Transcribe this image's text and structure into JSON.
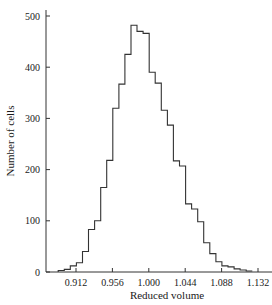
{
  "chart_data": {
    "type": "bar",
    "subtype": "histogram-step",
    "title": "",
    "xlabel": "Reduced volume",
    "ylabel": "Number of cells",
    "x_ticks": [
      0.912,
      0.956,
      1.0,
      1.044,
      1.088,
      1.132
    ],
    "x_tick_labels": [
      "0.912",
      "0.956",
      "1.000",
      "1.044",
      "1.088",
      "1.132"
    ],
    "y_ticks": [
      0,
      100,
      200,
      300,
      400,
      500
    ],
    "y_tick_labels": [
      "0",
      "100",
      "200",
      "300",
      "400",
      "500"
    ],
    "xlim": [
      0.8865,
      1.153
    ],
    "ylim": [
      0,
      530
    ],
    "bin_start": 0.8905,
    "bin_width": 0.00733,
    "values": [
      3,
      5,
      12,
      18,
      40,
      83,
      100,
      165,
      218,
      320,
      367,
      425,
      482,
      470,
      466,
      390,
      369,
      316,
      287,
      217,
      207,
      133,
      123,
      98,
      57,
      36,
      20,
      12,
      10,
      6,
      4,
      2
    ],
    "grid": false,
    "legend": null,
    "line_color": "#333333"
  }
}
